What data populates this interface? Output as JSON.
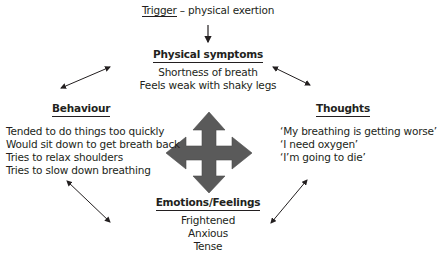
{
  "diagram": {
    "trigger": {
      "label": "Trigger",
      "separator": " – ",
      "value": "physical exertion"
    },
    "nodes": {
      "physical_symptoms": {
        "heading": "Physical symptoms",
        "lines": [
          "Shortness of breath",
          "Feels weak with shaky legs"
        ]
      },
      "behaviour": {
        "heading": "Behaviour",
        "lines": [
          "Tended to do things too quickly",
          "Would sit down to get breath back",
          "Tries to relax shoulders",
          "Tries to slow down breathing"
        ]
      },
      "thoughts": {
        "heading": "Thoughts",
        "lines": [
          "‘My breathing is getting worse’",
          "‘I need oxygen’",
          "‘I’m going to die’"
        ]
      },
      "emotions": {
        "heading": "Emotions/Feelings",
        "lines": [
          "Frightened",
          "Anxious",
          "Tense"
        ]
      }
    },
    "colors": {
      "text": "#231f20",
      "central_arrow": "#5a5a5a",
      "connector": "#231f20"
    }
  }
}
